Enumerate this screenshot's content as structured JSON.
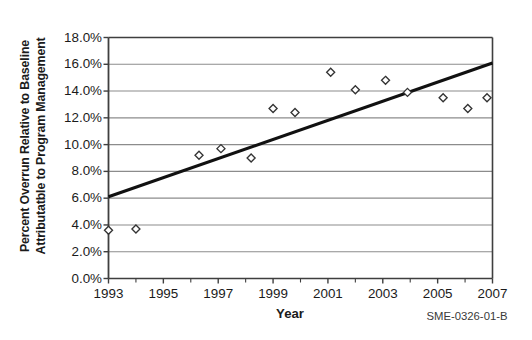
{
  "chart_data": {
    "type": "scatter",
    "title": "",
    "xlabel": "Year",
    "ylabel": "Percent Overrun Relative to Baseline Attributatble to Program Management",
    "ylabel_lines": [
      "Percent Overrun Relative to Baseline",
      "Attributatble to Program Management"
    ],
    "xlim": [
      1993,
      2007
    ],
    "ylim": [
      0,
      18
    ],
    "y_unit": "%",
    "grid": "horizontal",
    "legend": "none",
    "x_tick_labels": [
      "1993",
      "1995",
      "1997",
      "1999",
      "2001",
      "2003",
      "2005",
      "2007"
    ],
    "x_tick_values": [
      1993,
      1995,
      1997,
      1999,
      2001,
      2003,
      2005,
      2007
    ],
    "x_minor_tick_values": [
      1994,
      1996,
      1998,
      2000,
      2002,
      2004,
      2006
    ],
    "y_tick_labels": [
      "18.0%",
      "16.0%",
      "14.0%",
      "12.0%",
      "10.0%",
      "8.0%",
      "6.0%",
      "4.0%",
      "2.0%",
      "0.0%"
    ],
    "y_tick_values": [
      18.0,
      16.0,
      14.0,
      12.0,
      10.0,
      8.0,
      6.0,
      4.0,
      2.0,
      0.0
    ],
    "series": [
      {
        "name": "Program management overrun",
        "marker": "open-diamond",
        "points": [
          {
            "x": 1993.0,
            "y": 3.6
          },
          {
            "x": 1994.0,
            "y": 3.7
          },
          {
            "x": 1996.3,
            "y": 9.2
          },
          {
            "x": 1997.1,
            "y": 9.7
          },
          {
            "x": 1998.2,
            "y": 9.0
          },
          {
            "x": 1999.0,
            "y": 12.7
          },
          {
            "x": 1999.8,
            "y": 12.4
          },
          {
            "x": 2001.1,
            "y": 15.4
          },
          {
            "x": 2002.0,
            "y": 14.1
          },
          {
            "x": 2003.1,
            "y": 14.8
          },
          {
            "x": 2003.9,
            "y": 13.9
          },
          {
            "x": 2005.2,
            "y": 13.5
          },
          {
            "x": 2006.1,
            "y": 12.7
          },
          {
            "x": 2006.8,
            "y": 13.5
          }
        ]
      }
    ],
    "trendline": {
      "name": "Linear trend",
      "x_start": 1993.0,
      "y_start": 6.1,
      "x_end": 2007.0,
      "y_end": 16.1
    }
  },
  "annotations": {
    "source_note": "SME-0326-01-B"
  },
  "colors": {
    "plot_frame": "#3f3f3f",
    "gridline": "#8c8c8c",
    "trendline": "#111111",
    "marker_stroke": "#333333",
    "marker_fill": "#ffffff",
    "text": "#1b1b1b"
  }
}
